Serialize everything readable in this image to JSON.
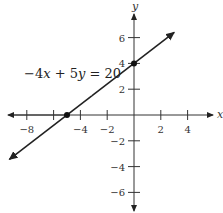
{
  "chart_data": {
    "type": "line",
    "title": "",
    "xlabel": "x",
    "ylabel": "y",
    "xlim": [
      -9.5,
      5.5
    ],
    "ylim": [
      -7.5,
      8
    ],
    "x_ticks": [
      -8,
      -6,
      -4,
      -2,
      2,
      4
    ],
    "x_tick_labels": [
      "−8",
      "",
      "−4",
      "−2",
      "2",
      "4"
    ],
    "y_ticks": [
      6,
      4,
      2,
      -2,
      -4,
      -6
    ],
    "y_tick_labels": [
      "6",
      "4",
      "2",
      "−2",
      "−4",
      "−6"
    ],
    "grid": false,
    "series": [
      {
        "name": "−4x + 5y = 20",
        "equation": "-4x + 5y = 20",
        "slope": 0.8,
        "intercept": 4,
        "x": [
          -9.3,
          3.0
        ],
        "y": [
          -3.44,
          6.4
        ],
        "color": "#222222"
      }
    ],
    "points": [
      {
        "x": 0,
        "y": 4,
        "label": "y-intercept"
      },
      {
        "x": -5,
        "y": 0,
        "label": "x-intercept"
      }
    ],
    "annotations": [
      {
        "text": "−4x + 5y = 20",
        "x": -7.8,
        "y": 3.2
      }
    ]
  },
  "labels": {
    "equation_prefix": "−4",
    "equation_x": "x",
    "equation_mid": " + 5",
    "equation_y": "y",
    "equation_suffix": " = 20",
    "x_axis": "x",
    "y_axis": "y"
  }
}
